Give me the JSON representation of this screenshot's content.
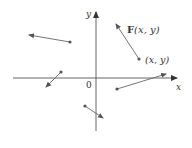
{
  "diagram": {
    "axes": {
      "x_label": "x",
      "y_label": "y",
      "origin_label": "0",
      "color": "#555555"
    },
    "vector_color": "#666666",
    "point_color": "#555555",
    "labels": {
      "field_label_bold": "F",
      "field_label_args": "(x, y)",
      "point_label": "(x, y)"
    },
    "vectors": [
      {
        "from": [
          70,
          42
        ],
        "to": [
          29,
          35
        ]
      },
      {
        "from": [
          61,
          72
        ],
        "to": [
          46,
          87
        ]
      },
      {
        "from": [
          85,
          106
        ],
        "to": [
          103,
          118
        ]
      },
      {
        "from": [
          117,
          89
        ],
        "to": [
          166,
          74
        ]
      },
      {
        "from": [
          139,
          59
        ],
        "to": [
          116,
          24
        ]
      }
    ]
  }
}
